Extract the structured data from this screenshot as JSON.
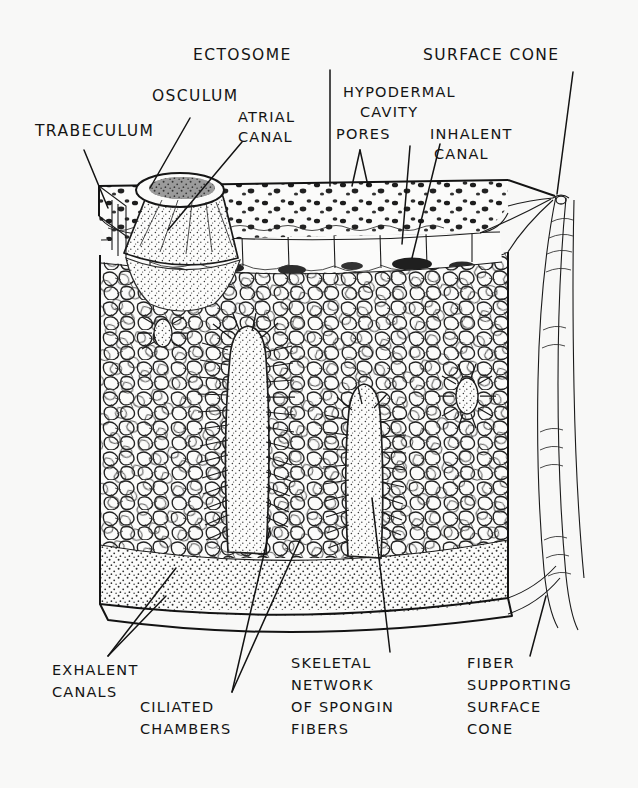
{
  "figure": {
    "background_color": "#f8f8f7",
    "ink_color": "#131313"
  },
  "labels": {
    "trabeculum": "TRABECULUM",
    "osculum": "OSCULUM",
    "ectosome": "ECTOSOME",
    "surface_cone": "SURFACE CONE",
    "atrial_canal_1": "ATRIAL",
    "atrial_canal_2": "CANAL",
    "hypodermal_1": "HYPODERMAL",
    "hypodermal_2": "CAVITY",
    "pores": "PORES",
    "inhalent_1": "INHALENT",
    "inhalent_2": "CANAL",
    "exhalent_1": "EXHALENT",
    "exhalent_2": "CANALS",
    "ciliated_1": "CILIATED",
    "ciliated_2": "CHAMBERS",
    "skeletal_1": "SKELETAL",
    "skeletal_2": "NETWORK",
    "skeletal_3": "OF  SPONGIN",
    "skeletal_4": "FIBERS",
    "fiber_1": "FIBER",
    "fiber_2": "SUPPORTING",
    "fiber_3": "SURFACE",
    "fiber_4": "CONE"
  },
  "structures": [
    {
      "name": "ectosome-layer",
      "description": "speckled surface layer with dark granules"
    },
    {
      "name": "hypodermal-cavity",
      "description": "open subdermal band with pillars"
    },
    {
      "name": "spongin-network",
      "description": "dense reticulated skeletal mesh"
    },
    {
      "name": "exhalent-canal",
      "description": "large stippled basal canals"
    },
    {
      "name": "ciliated-chamber",
      "description": "radiating oval chambers in mesh"
    },
    {
      "name": "osculum-cone",
      "description": "raised excurrent opening at left"
    },
    {
      "name": "surface-cone-fiber",
      "description": "long spongin fiber bundle at right"
    }
  ]
}
